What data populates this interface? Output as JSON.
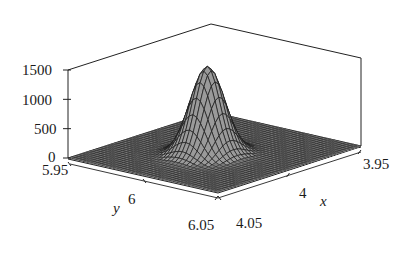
{
  "chart_data": {
    "type": "surface3d",
    "title": "",
    "xlabel": "x",
    "ylabel": "y",
    "zlabel": "",
    "x_ticks": [
      "3.95",
      "4",
      "4.05"
    ],
    "y_ticks": [
      "5.95",
      "6",
      "6.05"
    ],
    "z_ticks": [
      "0",
      "500",
      "1000",
      "1500"
    ],
    "xlim": [
      3.95,
      4.05
    ],
    "ylim": [
      5.95,
      6.05
    ],
    "zlim": [
      0,
      1500
    ],
    "peak": {
      "x": 4,
      "y": 6,
      "z": 1500
    },
    "base_value": 0,
    "grid": false,
    "box": true,
    "surface_color": "#8c8c8c",
    "mesh_color": "#1a1a1a"
  },
  "labels": {
    "z_1500": "1500",
    "z_1000": "1000",
    "z_500": "500",
    "z_0": "0",
    "y_595": "5.95",
    "y_6": "6",
    "y_605": "6.05",
    "y_name": "y",
    "x_405": "4.05",
    "x_4": "4",
    "x_395": "3.95",
    "x_name": "x"
  }
}
